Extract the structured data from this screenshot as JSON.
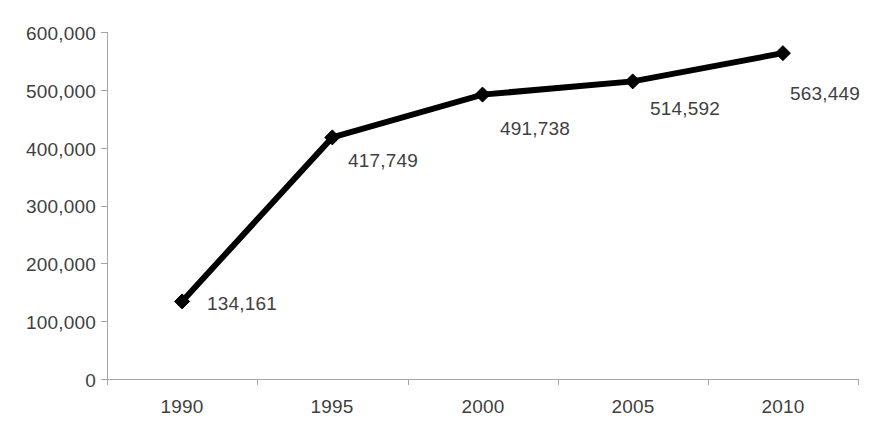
{
  "chart_data": {
    "type": "line",
    "title": "",
    "subtitle": "",
    "xlabel": "",
    "ylabel": "",
    "categories": [
      "1990",
      "1995",
      "2000",
      "2005",
      "2010"
    ],
    "x": [
      1990,
      1995,
      2000,
      2005,
      2010
    ],
    "values": [
      134161,
      417749,
      491738,
      514592,
      563449
    ],
    "data_labels": [
      "134,161",
      "417,749",
      "491,738",
      "514,592",
      "563,449"
    ],
    "series": [
      {
        "name": "",
        "values": [
          134161,
          417749,
          491738,
          514592,
          563449
        ],
        "color": "#000000",
        "marker": "diamond",
        "line_width": 6
      }
    ],
    "ylim": [
      0,
      600000
    ],
    "yticks": [
      0,
      100000,
      200000,
      300000,
      400000,
      500000,
      600000
    ],
    "ytick_labels": [
      "0",
      "100,000",
      "200,000",
      "300,000",
      "400,000",
      "500,000",
      "600,000"
    ],
    "grid": false,
    "legend": "none",
    "axis_color": "#a6a6a6",
    "text_color": "#3f3f3f",
    "background": "#ffffff"
  },
  "axis": {
    "y_labels": [
      "600,000",
      "500,000",
      "400,000",
      "300,000",
      "200,000",
      "100,000",
      "0"
    ],
    "x_labels": [
      "1990",
      "1995",
      "2000",
      "2005",
      "2010"
    ]
  }
}
